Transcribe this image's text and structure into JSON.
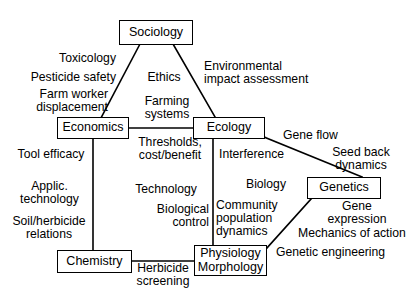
{
  "diagram": {
    "background_color": "#ffffff",
    "line_color": "#000000",
    "text_color": "#000000",
    "nodes": [
      {
        "id": "sociology",
        "label_lines": [
          "Sociology"
        ]
      },
      {
        "id": "economics",
        "label_lines": [
          "Economics"
        ]
      },
      {
        "id": "ecology",
        "label_lines": [
          "Ecology"
        ]
      },
      {
        "id": "genetics",
        "label_lines": [
          "Genetics"
        ]
      },
      {
        "id": "chemistry",
        "label_lines": [
          "Chemistry"
        ]
      },
      {
        "id": "physiology",
        "label_lines": [
          "Physiology",
          "Morphology"
        ]
      }
    ],
    "edge_labels": [
      {
        "id": "toxicology",
        "lines": [
          "Toxicology"
        ]
      },
      {
        "id": "pesticide-safety",
        "lines": [
          "Pesticide safety"
        ]
      },
      {
        "id": "farm-worker",
        "lines": [
          "Farm worker",
          "displacement"
        ]
      },
      {
        "id": "ethics",
        "lines": [
          "Ethics"
        ]
      },
      {
        "id": "environmental-impact",
        "lines": [
          "Environmental",
          "impact assessment"
        ]
      },
      {
        "id": "farming-systems",
        "lines": [
          "Farming",
          "systems"
        ]
      },
      {
        "id": "thresholds",
        "lines": [
          "Thresholds,",
          "cost/benefit"
        ]
      },
      {
        "id": "gene-flow",
        "lines": [
          "Gene flow"
        ]
      },
      {
        "id": "tool-efficacy",
        "lines": [
          "Tool efficacy"
        ]
      },
      {
        "id": "interference",
        "lines": [
          "Interference"
        ]
      },
      {
        "id": "seed-back-dynamics",
        "lines": [
          "Seed back",
          "dynamics"
        ]
      },
      {
        "id": "applic-technology",
        "lines": [
          "Applic.",
          "technology"
        ]
      },
      {
        "id": "technology",
        "lines": [
          "Technology"
        ]
      },
      {
        "id": "biology",
        "lines": [
          "Biology"
        ]
      },
      {
        "id": "biological-control",
        "lines": [
          "Biological",
          "control"
        ]
      },
      {
        "id": "community-population",
        "lines": [
          "Community",
          "population",
          "dynamics"
        ]
      },
      {
        "id": "gene-expression",
        "lines": [
          "Gene",
          "expression"
        ]
      },
      {
        "id": "soil-herbicide",
        "lines": [
          "Soil/herbicide",
          "relations"
        ]
      },
      {
        "id": "mechanics-of-action",
        "lines": [
          "Mechanics of action"
        ]
      },
      {
        "id": "genetic-engineering",
        "lines": [
          "Genetic engineering"
        ]
      },
      {
        "id": "herbicide-screening",
        "lines": [
          "Herbicide",
          "screening"
        ]
      }
    ],
    "connections": [
      {
        "from": "sociology",
        "to": "economics"
      },
      {
        "from": "sociology",
        "to": "ecology"
      },
      {
        "from": "economics",
        "to": "ecology"
      },
      {
        "from": "economics",
        "to": "chemistry"
      },
      {
        "from": "ecology",
        "to": "physiology"
      },
      {
        "from": "ecology",
        "to": "genetics"
      },
      {
        "from": "genetics",
        "to": "physiology"
      },
      {
        "from": "chemistry",
        "to": "physiology"
      }
    ]
  }
}
